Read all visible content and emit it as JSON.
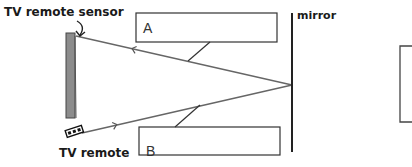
{
  "diagram": {
    "labels": {
      "sensor": "TV remote sensor",
      "remote": "TV remote",
      "mirror": "mirror",
      "box_a": "A",
      "box_b": "B"
    },
    "elements": {
      "tv": {
        "x": 66,
        "y": 33,
        "width": 10,
        "height": 85,
        "fill": "#8c8c8c"
      },
      "mirror": {
        "x": 292,
        "y1": 13,
        "y2": 152
      },
      "box_a": {
        "x": 136,
        "y": 13,
        "width": 141,
        "height": 29
      },
      "box_b": {
        "x": 139,
        "y": 127,
        "width": 141,
        "height": 28
      },
      "partial_box": {
        "x": 400,
        "y": 45,
        "width": 12,
        "height": 77
      },
      "reflection_point": {
        "x": 292,
        "y": 85
      },
      "remote_position": {
        "x": 78,
        "y": 134
      },
      "sensor_position": {
        "x": 76,
        "y": 36
      }
    },
    "colors": {
      "line": "#555555",
      "box_stroke": "#333333",
      "tv_fill": "#8c8c8c",
      "text": "#1a1a1a"
    }
  }
}
